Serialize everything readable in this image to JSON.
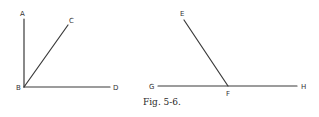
{
  "figure": {
    "caption": "Fig. 5-6.",
    "colors": {
      "line": "#3a3a3a",
      "label": "#333333",
      "background": "#ffffff"
    },
    "left_diagram": {
      "points": {
        "A": {
          "label": "A",
          "x": 24,
          "y": 19,
          "lx": 22,
          "ly": 16
        },
        "B": {
          "label": "B",
          "x": 24,
          "y": 87,
          "lx": 19,
          "ly": 90
        },
        "C": {
          "label": "C",
          "x": 68,
          "y": 25,
          "lx": 71,
          "ly": 23
        },
        "D": {
          "label": "D",
          "x": 110,
          "y": 87,
          "lx": 115,
          "ly": 90
        }
      },
      "segments": [
        [
          "B",
          "A"
        ],
        [
          "B",
          "C"
        ],
        [
          "B",
          "D"
        ]
      ]
    },
    "right_diagram": {
      "points": {
        "E": {
          "label": "E",
          "x": 184,
          "y": 20,
          "lx": 182,
          "ly": 16
        },
        "F": {
          "label": "F",
          "x": 228,
          "y": 86,
          "lx": 226,
          "ly": 95
        },
        "G": {
          "label": "G",
          "x": 158,
          "y": 86,
          "lx": 150,
          "ly": 89
        },
        "H": {
          "label": "H",
          "x": 297,
          "y": 86,
          "lx": 302,
          "ly": 89
        }
      },
      "segments": [
        [
          "F",
          "E"
        ],
        [
          "G",
          "H"
        ]
      ]
    }
  }
}
